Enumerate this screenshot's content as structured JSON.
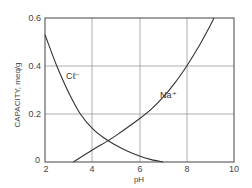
{
  "chart_data": {
    "type": "line",
    "title": "",
    "xlabel": "pH",
    "ylabel": "CAPACITY, meq/g",
    "xlim": [
      2,
      10
    ],
    "ylim": [
      0,
      0.6
    ],
    "grid": true,
    "xticks": [
      "2",
      "4",
      "6",
      "8",
      "10"
    ],
    "yticks": [
      "0",
      "0.2",
      "0.4",
      "0.6"
    ],
    "series": [
      {
        "name": "Cl⁻",
        "x": [
          2.0,
          2.5,
          3.0,
          3.5,
          4.0,
          4.5,
          5.0,
          5.5,
          6.0,
          6.5,
          7.0
        ],
        "values": [
          0.53,
          0.4,
          0.29,
          0.2,
          0.14,
          0.1,
          0.07,
          0.045,
          0.025,
          0.01,
          0.0
        ]
      },
      {
        "name": "Na⁺",
        "x": [
          3.2,
          4.0,
          4.6,
          5.0,
          6.0,
          6.5,
          7.0,
          7.5,
          8.0,
          8.5,
          9.0,
          9.15
        ],
        "values": [
          0.0,
          0.05,
          0.085,
          0.11,
          0.18,
          0.22,
          0.27,
          0.33,
          0.4,
          0.48,
          0.57,
          0.6
        ]
      }
    ],
    "annotations": [
      {
        "text": "Cℓ⁻",
        "x": 3.1,
        "y": 0.36
      },
      {
        "text": "Na⁺",
        "x": 7.0,
        "y": 0.27
      }
    ]
  },
  "labels": {
    "xlabel": "pH",
    "ylabel": "CAPACITY, meq/g",
    "cl": "Cℓ⁻",
    "na": "Na⁺"
  },
  "ticks": {
    "x": [
      "2",
      "4",
      "6",
      "8",
      "10"
    ],
    "y": [
      "0",
      "0.2",
      "0.4",
      "0.6"
    ]
  }
}
